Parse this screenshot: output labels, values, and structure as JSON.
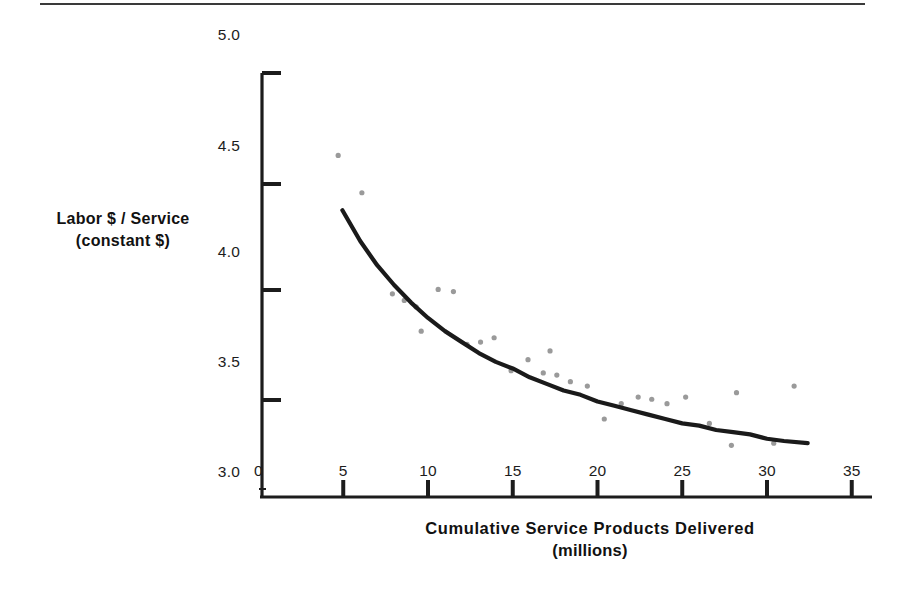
{
  "figure": {
    "top_rule": true,
    "background_color": "#ffffff",
    "ink_color": "#1c1c1c",
    "point_color": "#9a9a9a",
    "curve_color": "#1a1a1a"
  },
  "chart_data": {
    "type": "scatter",
    "title": "",
    "subtitle": "",
    "xlabel": "Cumulative Service Products Delivered",
    "xlabel_line2": "(millions)",
    "ylabel": "Labor $ / Service",
    "ylabel_line2": "(constant $)",
    "xlim": [
      0,
      35
    ],
    "ylim": [
      3.0,
      5.0
    ],
    "xticks": [
      0,
      5,
      10,
      15,
      20,
      25,
      30,
      35
    ],
    "xtick_labels": [
      "0",
      "5",
      "10",
      "15",
      "20",
      "25",
      "30",
      "35"
    ],
    "yticks": [
      3.0,
      3.5,
      4.0,
      4.5,
      5.0
    ],
    "ytick_labels": [
      "3.0",
      "3.5",
      "4.0",
      "4.5",
      "5.0"
    ],
    "grid": false,
    "legend": null,
    "points": [
      {
        "x": 4.7,
        "y": 4.5
      },
      {
        "x": 6.1,
        "y": 4.33
      },
      {
        "x": 7.9,
        "y": 3.87
      },
      {
        "x": 8.6,
        "y": 3.84
      },
      {
        "x": 9.3,
        "y": 3.81
      },
      {
        "x": 10.6,
        "y": 3.89
      },
      {
        "x": 11.5,
        "y": 3.88
      },
      {
        "x": 9.6,
        "y": 3.7
      },
      {
        "x": 12.3,
        "y": 3.64
      },
      {
        "x": 13.1,
        "y": 3.65
      },
      {
        "x": 13.9,
        "y": 3.67
      },
      {
        "x": 14.9,
        "y": 3.52
      },
      {
        "x": 15.9,
        "y": 3.57
      },
      {
        "x": 16.8,
        "y": 3.51
      },
      {
        "x": 17.6,
        "y": 3.5
      },
      {
        "x": 18.4,
        "y": 3.47
      },
      {
        "x": 17.2,
        "y": 3.61
      },
      {
        "x": 19.4,
        "y": 3.45
      },
      {
        "x": 20.4,
        "y": 3.3
      },
      {
        "x": 21.4,
        "y": 3.37
      },
      {
        "x": 22.4,
        "y": 3.4
      },
      {
        "x": 23.2,
        "y": 3.39
      },
      {
        "x": 24.1,
        "y": 3.37
      },
      {
        "x": 25.2,
        "y": 3.4
      },
      {
        "x": 26.6,
        "y": 3.28
      },
      {
        "x": 27.9,
        "y": 3.18
      },
      {
        "x": 28.2,
        "y": 3.42
      },
      {
        "x": 30.4,
        "y": 3.19
      },
      {
        "x": 31.6,
        "y": 3.45
      }
    ],
    "fit_curve": {
      "kind": "power-law",
      "x_start": 4.95,
      "x_end": 32.4,
      "y_start": 4.25,
      "y_end": 3.19,
      "points": [
        {
          "x": 4.95,
          "y": 4.25
        },
        {
          "x": 6.0,
          "y": 4.11
        },
        {
          "x": 7.0,
          "y": 4.0
        },
        {
          "x": 8.0,
          "y": 3.91
        },
        {
          "x": 9.0,
          "y": 3.83
        },
        {
          "x": 10.0,
          "y": 3.76
        },
        {
          "x": 11.0,
          "y": 3.7
        },
        {
          "x": 12.0,
          "y": 3.65
        },
        {
          "x": 13.0,
          "y": 3.6
        },
        {
          "x": 14.0,
          "y": 3.56
        },
        {
          "x": 15.0,
          "y": 3.53
        },
        {
          "x": 16.0,
          "y": 3.49
        },
        {
          "x": 17.0,
          "y": 3.46
        },
        {
          "x": 18.0,
          "y": 3.43
        },
        {
          "x": 19.0,
          "y": 3.41
        },
        {
          "x": 20.0,
          "y": 3.38
        },
        {
          "x": 21.0,
          "y": 3.36
        },
        {
          "x": 22.0,
          "y": 3.34
        },
        {
          "x": 23.0,
          "y": 3.32
        },
        {
          "x": 24.0,
          "y": 3.3
        },
        {
          "x": 25.0,
          "y": 3.28
        },
        {
          "x": 26.0,
          "y": 3.27
        },
        {
          "x": 27.0,
          "y": 3.25
        },
        {
          "x": 28.0,
          "y": 3.24
        },
        {
          "x": 29.0,
          "y": 3.23
        },
        {
          "x": 30.0,
          "y": 3.21
        },
        {
          "x": 31.0,
          "y": 3.2
        },
        {
          "x": 32.4,
          "y": 3.19
        }
      ]
    }
  }
}
